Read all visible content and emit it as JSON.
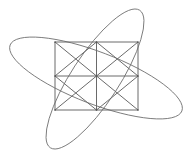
{
  "figure": {
    "title": "Geometric line figure: tiled square grid with diagonals and two crossing ellipses",
    "canvas": {
      "width": 191,
      "height": 162,
      "background": "#ffffff"
    },
    "style": {
      "stroke_color": "#595959",
      "ellipse_stroke_color": "#6b6b6b",
      "stroke_width": 0.9,
      "ellipse_stroke_width": 0.8,
      "fill": "none"
    },
    "grid": {
      "name": "square-grid-with-diagonals",
      "rows": 2,
      "cols": 2,
      "left": 55,
      "top": 42,
      "right": 138,
      "bottom": 110,
      "cell_width": 41.5,
      "cell_height": 34,
      "center_x": 96.5,
      "center_y": 76,
      "outline_points": "55,42 138,42 138,110 55,110",
      "midline_vertical": "96.5,42 96.5,110",
      "midline_horizontal": "55,76 138,76",
      "cells": [
        {
          "name": "cell-top-left",
          "x": 55,
          "y": 42,
          "w": 41.5,
          "h": 34,
          "diagonal_a": "55,42 96.5,76",
          "diagonal_b": "96.5,42 55,76"
        },
        {
          "name": "cell-top-right",
          "x": 96.5,
          "y": 42,
          "w": 41.5,
          "h": 34,
          "diagonal_a": "96.5,42 138,76",
          "diagonal_b": "138,42 96.5,76"
        },
        {
          "name": "cell-bottom-left",
          "x": 55,
          "y": 76,
          "w": 41.5,
          "h": 34,
          "diagonal_a": "55,76 96.5,110",
          "diagonal_b": "96.5,76 55,110"
        },
        {
          "name": "cell-bottom-right",
          "x": 96.5,
          "y": 76,
          "w": 41.5,
          "h": 34,
          "diagonal_a": "96.5,76 138,110",
          "diagonal_b": "138,76 96.5,110"
        }
      ],
      "vertices": [
        {
          "name": "vertex-center",
          "x": 96.5,
          "y": 76
        },
        {
          "name": "vertex-top-mid",
          "x": 96.5,
          "y": 42
        },
        {
          "name": "vertex-bottom-mid",
          "x": 96.5,
          "y": 110
        },
        {
          "name": "vertex-left-mid",
          "x": 55,
          "y": 76
        },
        {
          "name": "vertex-right-mid",
          "x": 138,
          "y": 76
        },
        {
          "name": "vertex-top-left",
          "x": 55,
          "y": 42
        },
        {
          "name": "vertex-top-right",
          "x": 138,
          "y": 42
        },
        {
          "name": "vertex-bottom-left",
          "x": 55,
          "y": 110
        },
        {
          "name": "vertex-bottom-right",
          "x": 138,
          "y": 110
        }
      ]
    },
    "ellipses": [
      {
        "name": "ellipse-descending",
        "center_x": 96,
        "center_y": 78,
        "radius_x": 92,
        "radius_y": 26,
        "rotation_deg": 21,
        "description": "long ellipse tilted downward to the right, left tip near upper-left, right tip near lower-right"
      },
      {
        "name": "ellipse-ascending",
        "center_x": 95,
        "center_y": 79,
        "radius_x": 82,
        "radius_y": 24,
        "rotation_deg": -57,
        "description": "long ellipse tilted upward to the right, bottom tip near lower-left, top tip near upper-right"
      }
    ]
  }
}
